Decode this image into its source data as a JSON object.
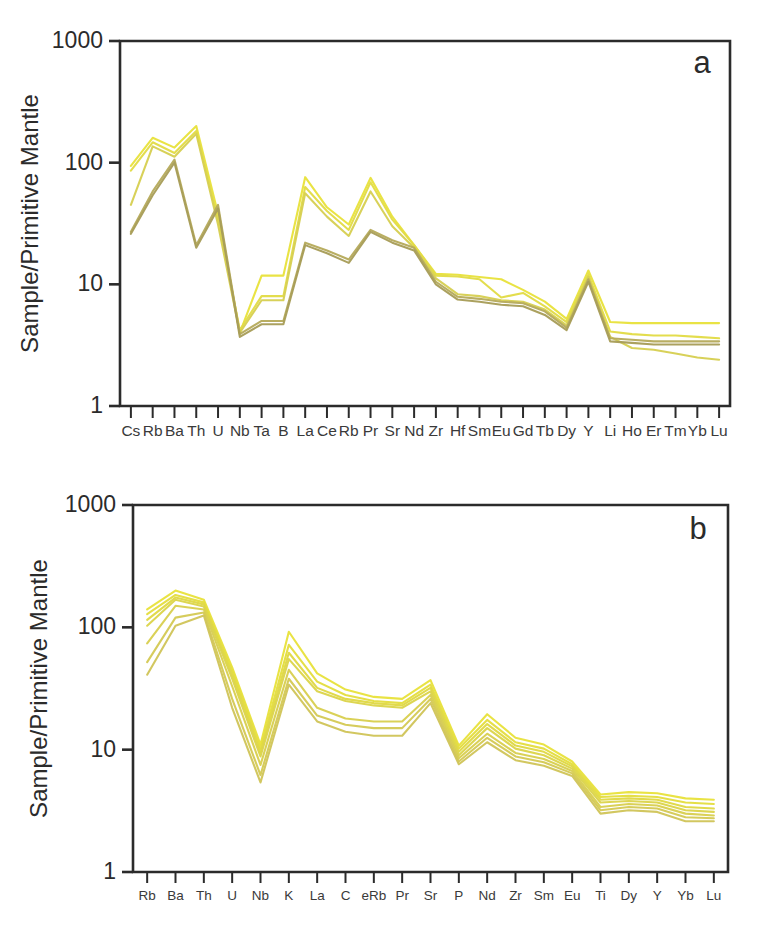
{
  "figure": {
    "background": "#ffffff",
    "axis_color": "#2b2b2b"
  },
  "panels": [
    {
      "id": "a",
      "letter": "a",
      "ylabel": "Sample/Primitive Mantle"
    },
    {
      "id": "b",
      "letter": "b",
      "ylabel": "Sample/Primitive Mantle"
    }
  ],
  "chart_data": [
    {
      "type": "line",
      "title": "a",
      "xlabel": "",
      "ylabel": "Sample/Primitive Mantle",
      "yscale": "log",
      "ylim": [
        1,
        1000
      ],
      "ytick_labels": [
        "1000",
        "100",
        "10",
        "1"
      ],
      "ytick_values": [
        1000,
        100,
        10,
        1
      ],
      "grid": false,
      "legend": "none",
      "categories": [
        "Cs",
        "Rb",
        "Ba",
        "Th",
        "U",
        "Nb",
        "Ta",
        "B",
        "La",
        "Ce",
        "Rb",
        "Pr",
        "Sr",
        "Nd",
        "Zr",
        "Hf",
        "Sm",
        "Eu",
        "Gd",
        "Tb",
        "Dy",
        "Y",
        "Li",
        "Ho",
        "Er",
        "Tm",
        "Yb",
        "Lu"
      ],
      "colors": [
        "#e8e23c",
        "#e2dc46",
        "#d6cf52",
        "#b6ab5c",
        "#a89d58"
      ],
      "series": [
        {
          "name": "sample-1",
          "color": "#e8e23c",
          "values": [
            94,
            160,
            133,
            200,
            38,
            4.0,
            11.8,
            11.8,
            76,
            43,
            31,
            75,
            36,
            21,
            12.2,
            12.0,
            11.5,
            11.0,
            9.0,
            7.2,
            5.2,
            13.0,
            4.9,
            4.8,
            4.8,
            4.8,
            4.8,
            4.8
          ]
        },
        {
          "name": "sample-2",
          "color": "#e2dc46",
          "values": [
            86,
            147,
            120,
            182,
            34,
            4.2,
            8.0,
            8.0,
            63,
            40,
            28,
            69,
            34,
            21,
            11.8,
            11.6,
            11.0,
            7.8,
            8.5,
            6.6,
            4.9,
            12.0,
            4.1,
            3.9,
            3.8,
            3.8,
            3.7,
            3.6
          ]
        },
        {
          "name": "sample-3",
          "color": "#d6cf52",
          "values": [
            45,
            136,
            112,
            173,
            31,
            4.0,
            7.4,
            7.4,
            56,
            36,
            25,
            58,
            30,
            20,
            11.2,
            8.3,
            8.0,
            7.4,
            7.2,
            6.2,
            4.6,
            11.5,
            3.7,
            3.0,
            2.9,
            2.7,
            2.5,
            2.4
          ]
        },
        {
          "name": "sample-4",
          "color": "#b6ab5c",
          "values": [
            27,
            58,
            106,
            21,
            45,
            3.9,
            5.0,
            5.0,
            22,
            19,
            16,
            28,
            23,
            20,
            10.5,
            7.9,
            7.6,
            7.2,
            7.0,
            6.0,
            4.4,
            11.0,
            3.6,
            3.5,
            3.4,
            3.4,
            3.4,
            3.4
          ]
        },
        {
          "name": "sample-5",
          "color": "#a89d58",
          "values": [
            26,
            54,
            100,
            20,
            42,
            3.7,
            4.7,
            4.7,
            21,
            18,
            15,
            27,
            22,
            19,
            10.0,
            7.5,
            7.2,
            6.8,
            6.6,
            5.6,
            4.2,
            10.5,
            3.4,
            3.3,
            3.2,
            3.2,
            3.2,
            3.2
          ]
        }
      ]
    },
    {
      "type": "line",
      "title": "b",
      "xlabel": "",
      "ylabel": "Sample/Primitive Mantle",
      "yscale": "log",
      "ylim": [
        1,
        1000
      ],
      "ytick_labels": [
        "1000",
        "100",
        "10",
        "1"
      ],
      "ytick_values": [
        1000,
        100,
        10,
        1
      ],
      "grid": false,
      "legend": "none",
      "categories": [
        "Rb",
        "Ba",
        "Th",
        "U",
        "Nb",
        "K",
        "La",
        "C",
        "eRb",
        "Pr",
        "Sr",
        "P",
        "Nd",
        "Zr",
        "Sm",
        "Eu",
        "Ti",
        "Dy",
        "Y",
        "Yb",
        "Lu"
      ],
      "colors": [
        "#e8e23c",
        "#e4de40",
        "#e0d945",
        "#dcd44b",
        "#d8cf50",
        "#d4ca55",
        "#d0c55a"
      ],
      "series": [
        {
          "name": "sample-1",
          "color": "#e8e23c",
          "values": [
            140,
            200,
            168,
            47,
            11.0,
            92,
            42,
            31,
            27,
            26,
            37,
            10.8,
            19.5,
            12.5,
            11.0,
            8.0,
            4.3,
            4.5,
            4.4,
            4.0,
            3.9
          ]
        },
        {
          "name": "sample-2",
          "color": "#e4de40",
          "values": [
            128,
            184,
            160,
            44,
            10.2,
            72,
            36,
            28,
            25,
            24,
            34,
            10.2,
            17.5,
            11.5,
            10.2,
            7.6,
            4.1,
            4.2,
            4.1,
            3.7,
            3.6
          ]
        },
        {
          "name": "sample-3",
          "color": "#e0d945",
          "values": [
            115,
            175,
            154,
            41,
            9.5,
            62,
            32,
            26,
            24,
            23,
            32,
            9.6,
            16.2,
            10.8,
            9.6,
            7.3,
            3.9,
            4.0,
            3.9,
            3.4,
            3.3
          ]
        },
        {
          "name": "sample-4",
          "color": "#dcd44b",
          "values": [
            103,
            168,
            148,
            38,
            8.8,
            55,
            30,
            25,
            23,
            22,
            30,
            9.0,
            15.0,
            10.2,
            9.0,
            7.0,
            3.7,
            3.8,
            3.7,
            3.2,
            3.1
          ]
        },
        {
          "name": "sample-5",
          "color": "#d8cf50",
          "values": [
            74,
            150,
            140,
            33,
            7.5,
            45,
            22,
            18,
            17,
            17,
            28,
            8.5,
            13.5,
            9.4,
            8.4,
            6.7,
            3.4,
            3.6,
            3.5,
            3.0,
            2.9
          ]
        },
        {
          "name": "sample-6",
          "color": "#d4ca55",
          "values": [
            52,
            120,
            132,
            26,
            6.2,
            38,
            19,
            16,
            15,
            15,
            26,
            8.0,
            12.5,
            8.8,
            7.9,
            6.4,
            3.2,
            3.4,
            3.3,
            2.8,
            2.75
          ]
        },
        {
          "name": "sample-7",
          "color": "#d0c55a",
          "values": [
            41,
            103,
            125,
            22,
            5.4,
            34,
            17,
            14,
            13,
            13,
            24,
            7.6,
            11.5,
            8.2,
            7.4,
            6.1,
            3.0,
            3.2,
            3.1,
            2.6,
            2.6
          ]
        }
      ]
    }
  ]
}
